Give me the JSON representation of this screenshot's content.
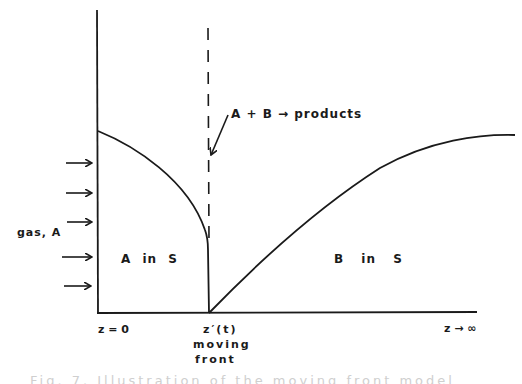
{
  "diagram": {
    "type": "concentration-profile",
    "labels": {
      "reaction": "A + B → products",
      "gas_source": "gas, A",
      "region_left": "A in S",
      "region_right": "B in S",
      "z_origin": "z = 0",
      "z_front": "z′(t)",
      "front_line1": "moving",
      "front_line2": "front",
      "z_infinity": "z → ∞"
    },
    "inflow_arrows": 5,
    "caption": "Fig. 7. Illustration of the moving front model"
  },
  "colors": {
    "ink": "#1a1a1a",
    "background": "#ffffff"
  }
}
